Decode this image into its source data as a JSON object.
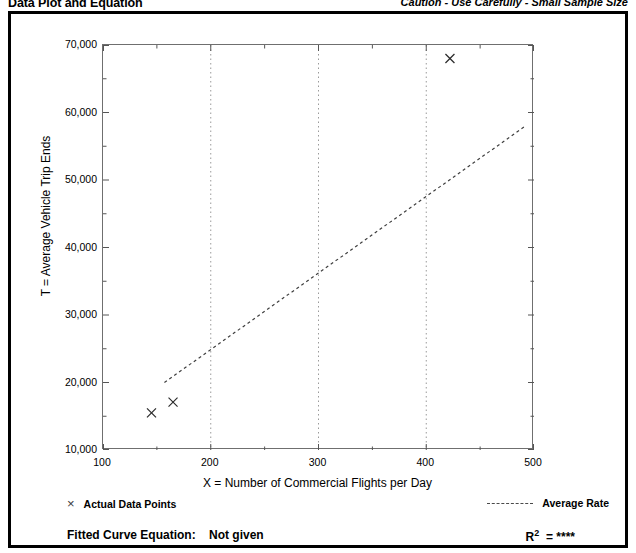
{
  "header": {
    "title": "Data Plot and Equation",
    "caution": "Caution - Use Carefully - Small Sample Size"
  },
  "legend": {
    "points_marker": "×",
    "points_label": "Actual Data Points",
    "rate_label": "Average Rate"
  },
  "footer": {
    "equation_label": "Fitted Curve Equation:",
    "equation_value": "Not given",
    "r2_label": "R",
    "r2_exponent": "2",
    "r2_value": "= ****"
  },
  "chart_data": {
    "type": "scatter",
    "title": "Data Plot and Equation",
    "xlabel": "X = Number of Commercial Flights per Day",
    "ylabel": "T = Average Vehicle Trip Ends",
    "xlim": [
      100,
      500
    ],
    "ylim": [
      10000,
      70000
    ],
    "xticks": [
      100,
      200,
      300,
      400,
      500
    ],
    "xtick_labels": [
      "100",
      "200",
      "300",
      "400",
      "500"
    ],
    "xminorticks": [
      150,
      250,
      350,
      450
    ],
    "yticks": [
      10000,
      20000,
      30000,
      40000,
      50000,
      60000,
      70000
    ],
    "ytick_labels": [
      "10,000",
      "20,000",
      "30,000",
      "40,000",
      "50,000",
      "60,000",
      "70,000"
    ],
    "yminorticks": [
      15000,
      25000,
      35000,
      45000,
      55000,
      65000
    ],
    "grid": "dotted vertical gridlines at x = 200, 300, 400",
    "gridlines_x": [
      200,
      300,
      400
    ],
    "legend_position": "below-plot",
    "series": [
      {
        "name": "Actual Data Points",
        "type": "scatter",
        "marker": "x",
        "points": [
          {
            "x": 145,
            "y": 15500
          },
          {
            "x": 165,
            "y": 17100
          },
          {
            "x": 422,
            "y": 68000
          }
        ]
      },
      {
        "name": "Average Rate",
        "type": "line",
        "style": "dashed",
        "endpoints": [
          {
            "x": 157,
            "y": 20000
          },
          {
            "x": 492,
            "y": 58000
          }
        ]
      }
    ]
  }
}
